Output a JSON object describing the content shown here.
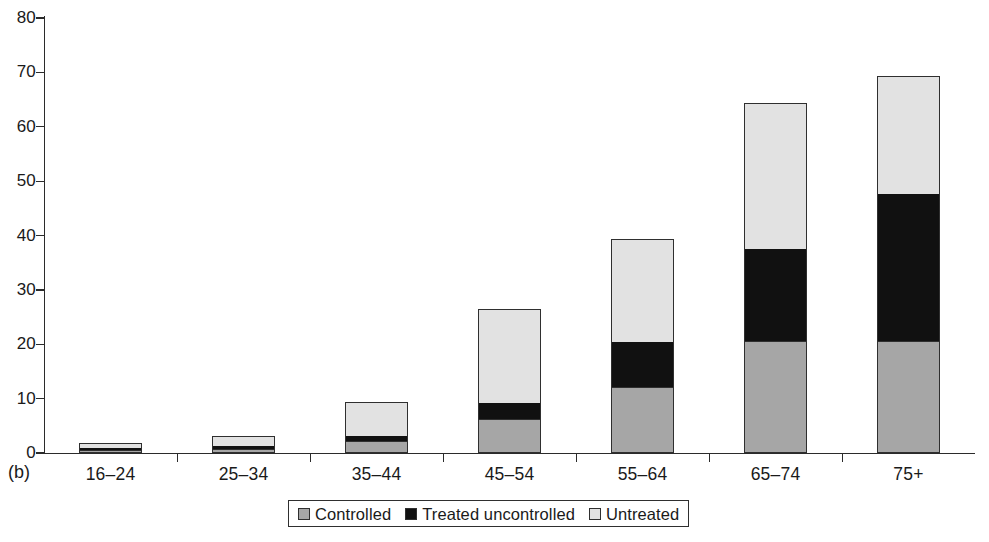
{
  "panel": {
    "label": "(b)"
  },
  "axes": {
    "y_ticks": [
      "0",
      "10",
      "20",
      "30",
      "40",
      "50",
      "60",
      "70",
      "80"
    ],
    "y_min": 0,
    "y_max": 80,
    "y_step": 10
  },
  "legend": {
    "items": [
      {
        "label": "Controlled",
        "color": "#a6a6a6",
        "icon": "legend-swatch-controlled"
      },
      {
        "label": "Treated uncontrolled",
        "color": "#111111",
        "icon": "legend-swatch-treated-uncontrolled"
      },
      {
        "label": "Untreated",
        "color": "#e2e2e2",
        "icon": "legend-swatch-untreated"
      }
    ]
  },
  "chart_data": {
    "type": "bar",
    "subtype": "stacked",
    "title": "",
    "subtitle": "",
    "xlabel": "",
    "ylabel": "",
    "ylim": [
      0,
      80
    ],
    "yticks": [
      0,
      10,
      20,
      30,
      40,
      50,
      60,
      70,
      80
    ],
    "grid": false,
    "legend_position": "bottom",
    "categories": [
      "16–24",
      "25–34",
      "35–44",
      "45–54",
      "55–64",
      "65–74",
      "75+"
    ],
    "series": [
      {
        "name": "Controlled",
        "color": "#a6a6a6",
        "values": [
          0.6,
          0.8,
          2.2,
          6.2,
          12.1,
          20.6,
          20.6
        ]
      },
      {
        "name": "Treated uncontrolled",
        "color": "#111111",
        "values": [
          0.3,
          0.4,
          1.0,
          3.0,
          8.3,
          17.0,
          27.0
        ]
      },
      {
        "name": "Untreated",
        "color": "#e2e2e2",
        "values": [
          1.0,
          1.9,
          6.1,
          17.2,
          18.9,
          26.7,
          21.8
        ]
      }
    ],
    "totals": [
      1.9,
      3.1,
      9.3,
      26.4,
      39.3,
      64.3,
      69.4
    ],
    "annotations": [
      "(b)"
    ]
  }
}
